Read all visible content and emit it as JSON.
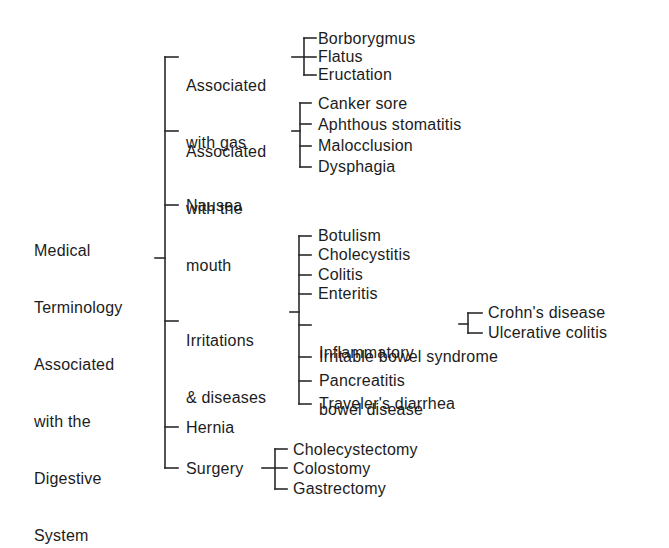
{
  "diagram": {
    "type": "tree-bracket",
    "root": {
      "label": "Medical Terminology Associated with the Digestive System",
      "lines": [
        "Medical",
        "Terminology",
        "Associated",
        "with the",
        "Digestive",
        "System"
      ]
    },
    "branches": [
      {
        "id": "gas",
        "lines": [
          "Associated",
          "with gas"
        ],
        "children": [
          "Borborygmus",
          "Flatus",
          "Eructation"
        ]
      },
      {
        "id": "mouth",
        "lines": [
          "Associated",
          "with the",
          "mouth"
        ],
        "children": [
          "Canker sore",
          "Aphthous stomatitis",
          "Malocclusion",
          "Dysphagia"
        ]
      },
      {
        "id": "nausea",
        "lines": [
          "Nausea"
        ],
        "children": []
      },
      {
        "id": "irritations",
        "lines": [
          "Irritations",
          "& diseases"
        ],
        "children": [
          "Botulism",
          "Cholecystitis",
          "Colitis",
          "Enteritis",
          {
            "lines": [
              "Inflammatory",
              "bowel disease"
            ],
            "children": [
              "Crohn's disease",
              "Ulcerative colitis"
            ]
          },
          "Irritable bowel syndrome",
          "Pancreatitis",
          "Traveler's diarrhea"
        ]
      },
      {
        "id": "hernia",
        "lines": [
          "Hernia"
        ],
        "children": []
      },
      {
        "id": "surgery",
        "lines": [
          "Surgery"
        ],
        "children": [
          "Cholecystectomy",
          "Colostomy",
          "Gastrectomy"
        ]
      }
    ],
    "colors": {
      "text": "#1c1c1c",
      "lines": "#2a2a2a",
      "background": "#ffffff"
    }
  }
}
